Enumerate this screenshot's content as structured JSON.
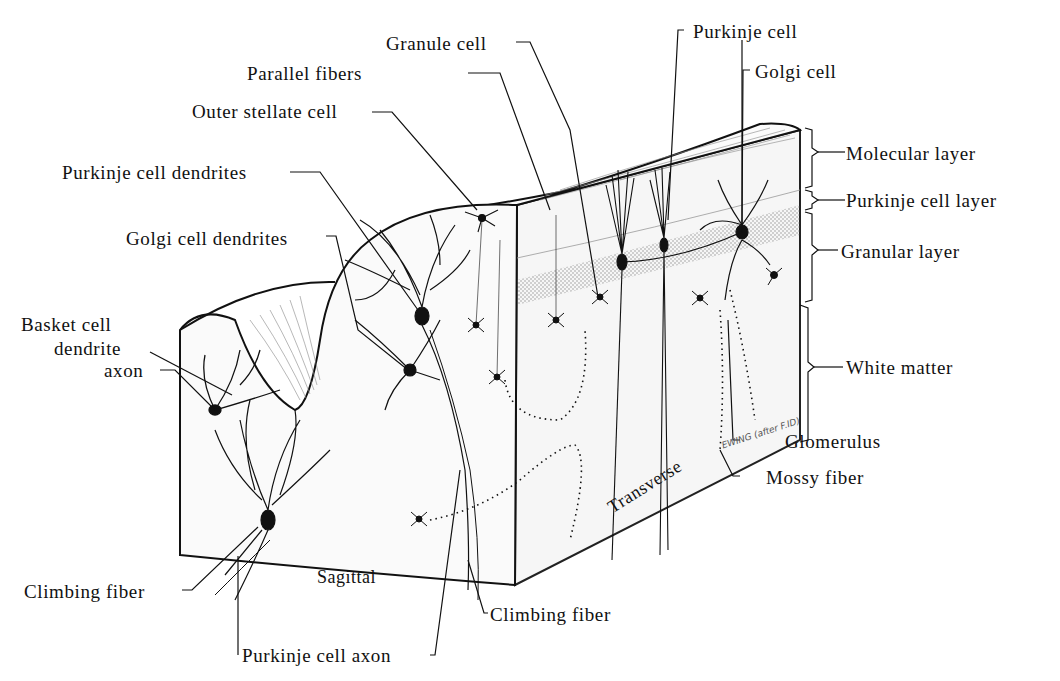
{
  "figure": {
    "leader_color": "#111111",
    "fill_color": "#f4f4f4",
    "stipple_color": "#555555"
  },
  "labels": {
    "granule_cell": "Granule cell",
    "parallel_fibers": "Parallel fibers",
    "outer_stellate_cell": "Outer stellate cell",
    "purkinje_cell_dendrites": "Purkinje cell dendrites",
    "golgi_cell_dendrites": "Golgi cell dendrites",
    "basket_cell": "Basket cell",
    "basket_dendrite": "dendrite",
    "basket_axon": "axon",
    "climbing_fiber_left": "Climbing fiber",
    "purkinje_cell_axon": "Purkinje cell axon",
    "climbing_fiber_right": "Climbing fiber",
    "purkinje_cell": "Purkinje cell",
    "golgi_cell": "Golgi cell",
    "glomerulus": "Glomerulus",
    "mossy_fiber": "Mossy fiber"
  },
  "layers": [
    {
      "name": "Molecular layer"
    },
    {
      "name": "Purkinje cell layer"
    },
    {
      "name": "Granular layer"
    },
    {
      "name": "White matter"
    }
  ],
  "planes": {
    "sagittal": "Sagittal",
    "transverse": "Transverse"
  },
  "signature": "EWING (after F.ID)"
}
